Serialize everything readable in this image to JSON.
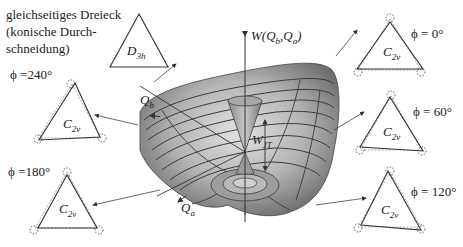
{
  "caption": {
    "lines": [
      "gleichseitiges Dreieck",
      "(konische Durch-",
      "schneidung)"
    ]
  },
  "center_triangle": {
    "symmetry": "D",
    "symmetry_sub": "3h"
  },
  "axes": {
    "vertical": "W(Q",
    "vertical_full": "W(Qb,Qa)",
    "q_b": "Q",
    "q_b_sub": "b",
    "q_a": "Q",
    "q_a_sub": "a",
    "barrier": "W",
    "barrier_sub": "JT"
  },
  "distortions": [
    {
      "id": "phi-0",
      "phi_label": "ϕ = 0°",
      "symmetry": "C",
      "symmetry_sub": "2v"
    },
    {
      "id": "phi-60",
      "phi_label": "ϕ = 60°",
      "symmetry": "C",
      "symmetry_sub": "2v"
    },
    {
      "id": "phi-120",
      "phi_label": "ϕ = 120°",
      "symmetry": "C",
      "symmetry_sub": "2v"
    },
    {
      "id": "phi-180",
      "phi_label": "ϕ =180°",
      "symmetry": "C",
      "symmetry_sub": "2v"
    },
    {
      "id": "phi-240",
      "phi_label": "ϕ =240°",
      "symmetry": "C",
      "symmetry_sub": "2v"
    }
  ],
  "colors": {
    "surface_light": "#d4d4d4",
    "surface_mid": "#a8a8a8",
    "surface_dark": "#6e6e6e",
    "contour": "#3a3a3a",
    "line": "#333333"
  }
}
